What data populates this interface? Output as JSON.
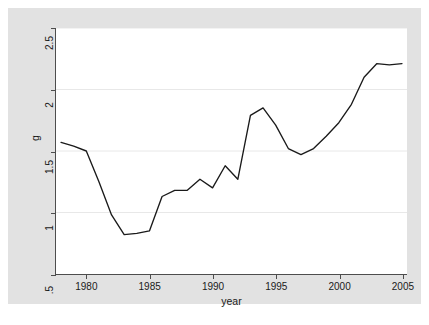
{
  "chart_data": {
    "type": "line",
    "title": "",
    "xlabel": "year",
    "ylabel": "g",
    "xlim": [
      1977.6,
      2005.4
    ],
    "ylim": [
      0.5,
      2.5
    ],
    "xticks": [
      1980,
      1985,
      1990,
      1995,
      2000,
      2005
    ],
    "xtick_labels": [
      "1980",
      "1985",
      "1990",
      "1995",
      "2000",
      "2005"
    ],
    "yticks": [
      0.5,
      1,
      1.5,
      2,
      2.5
    ],
    "ytick_labels": [
      ".5",
      "1",
      "1.5",
      "2",
      "2.5"
    ],
    "grid": "horizontal",
    "legend": "none",
    "line_color": "#1a1a1a",
    "series": [
      {
        "name": "g",
        "x": [
          1978,
          1979,
          1980,
          1981,
          1982,
          1983,
          1984,
          1985,
          1986,
          1987,
          1988,
          1989,
          1990,
          1991,
          1992,
          1993,
          1994,
          1995,
          1996,
          1997,
          1998,
          1999,
          2000,
          2001,
          2002,
          2003,
          2004,
          2005
        ],
        "values": [
          1.57,
          1.54,
          1.5,
          1.25,
          0.98,
          0.82,
          0.83,
          0.85,
          1.13,
          1.18,
          1.18,
          1.27,
          1.2,
          1.38,
          1.27,
          1.79,
          1.85,
          1.71,
          1.52,
          1.47,
          1.52,
          1.62,
          1.73,
          1.88,
          2.1,
          2.21,
          2.2,
          2.21
        ]
      }
    ]
  },
  "figure": {
    "background_color": "#e2e2e2",
    "plot_background_color": "#ffffff",
    "gridline_color": "#e8e8e8",
    "axis_color": "#4d4d4d"
  }
}
